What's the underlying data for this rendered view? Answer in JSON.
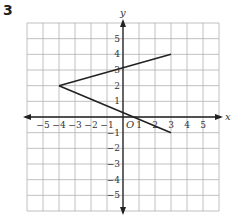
{
  "problem": {
    "number": "3"
  },
  "chart_data": {
    "type": "line",
    "title": "",
    "xlabel": "x",
    "ylabel": "y",
    "origin_label": "O",
    "xlim": [
      -6,
      6
    ],
    "ylim": [
      -6,
      6
    ],
    "grid": true,
    "x_ticks": [
      -5,
      -4,
      -3,
      -2,
      -1,
      1,
      2,
      3,
      4,
      5
    ],
    "y_ticks": [
      -5,
      -4,
      -3,
      -2,
      -1,
      1,
      2,
      3,
      4,
      5
    ],
    "series": [
      {
        "name": "segment-upper",
        "points": [
          [
            -4,
            2
          ],
          [
            3,
            4
          ]
        ]
      },
      {
        "name": "segment-lower",
        "points": [
          [
            -4,
            2
          ],
          [
            3,
            -1
          ]
        ]
      }
    ],
    "colors": {
      "grid": "#b0b0b0",
      "axis": "#222222",
      "line": "#222222"
    }
  }
}
